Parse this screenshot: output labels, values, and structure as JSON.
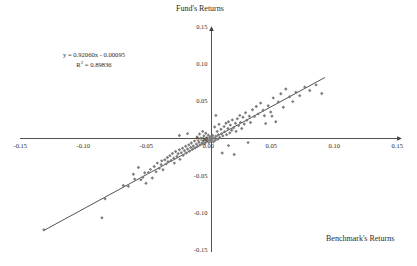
{
  "chart_data": {
    "type": "scatter",
    "title": "",
    "xlabel": "Benchmark's Returns",
    "ylabel": "Fund's Returns",
    "xlim": [
      -0.15,
      0.15
    ],
    "ylim": [
      -0.15,
      0.15
    ],
    "xticks": [
      -0.15,
      -0.1,
      -0.05,
      0.0,
      0.05,
      0.1,
      0.15
    ],
    "xtick_labels": [
      "-0.15",
      "-0.10",
      "-0.05",
      "0.00",
      "0.05",
      "0.10",
      "0.15"
    ],
    "yticks": [
      -0.15,
      -0.1,
      -0.05,
      0.0,
      0.05,
      0.1,
      0.15
    ],
    "ytick_labels": [
      "-0.15",
      "-0.10",
      "-0.05",
      "0.00",
      "0.05",
      "0.10",
      "0.15"
    ],
    "grid": false,
    "legend": false,
    "axes_style": "origin-centered-with-arrows",
    "marker": "diamond",
    "marker_color": "#7c7c7c",
    "trendline": {
      "slope": 0.9206,
      "intercept": -0.00095,
      "r_squared": 0.89836,
      "equation_label": "y = 0.92060x - 0.00095",
      "r2_label": "R² = 0.89836",
      "x_start": -0.133,
      "x_end": 0.09,
      "color": "#3f3f3f"
    },
    "points": [
      [
        -0.133,
        -0.1225
      ],
      [
        -0.087,
        -0.1065
      ],
      [
        -0.0845,
        -0.081
      ],
      [
        -0.07,
        -0.063
      ],
      [
        -0.066,
        -0.064
      ],
      [
        -0.062,
        -0.048
      ],
      [
        -0.061,
        -0.0545
      ],
      [
        -0.058,
        -0.039
      ],
      [
        -0.056,
        -0.0555
      ],
      [
        -0.0545,
        -0.052
      ],
      [
        -0.053,
        -0.046
      ],
      [
        -0.052,
        -0.06
      ],
      [
        -0.05,
        -0.0455
      ],
      [
        -0.0485,
        -0.0415
      ],
      [
        -0.047,
        -0.053
      ],
      [
        -0.0455,
        -0.0375
      ],
      [
        -0.044,
        -0.0445
      ],
      [
        -0.043,
        -0.033
      ],
      [
        -0.0415,
        -0.04
      ],
      [
        -0.04,
        -0.035
      ],
      [
        -0.0395,
        -0.03
      ],
      [
        -0.0385,
        -0.042
      ],
      [
        -0.037,
        -0.0285
      ],
      [
        -0.036,
        -0.034
      ],
      [
        -0.035,
        -0.0255
      ],
      [
        -0.0345,
        -0.031
      ],
      [
        -0.033,
        -0.023
      ],
      [
        -0.032,
        -0.0295
      ],
      [
        -0.031,
        -0.02
      ],
      [
        -0.03,
        -0.0265
      ],
      [
        -0.0295,
        -0.033
      ],
      [
        -0.0285,
        -0.0175
      ],
      [
        -0.0275,
        -0.024
      ],
      [
        -0.0265,
        -0.0205
      ],
      [
        -0.0255,
        -0.015
      ],
      [
        -0.025,
        -0.028
      ],
      [
        -0.024,
        -0.019
      ],
      [
        -0.023,
        -0.013
      ],
      [
        -0.0225,
        -0.0225
      ],
      [
        -0.0215,
        -0.0165
      ],
      [
        -0.0205,
        -0.0105
      ],
      [
        -0.02,
        -0.0195
      ],
      [
        -0.019,
        -0.014
      ],
      [
        -0.018,
        -0.0085
      ],
      [
        -0.0175,
        -0.017
      ],
      [
        -0.0165,
        -0.012
      ],
      [
        -0.016,
        -0.006
      ],
      [
        -0.015,
        -0.0145
      ],
      [
        -0.0145,
        -0.01
      ],
      [
        -0.0135,
        -0.0035
      ],
      [
        -0.013,
        -0.0125
      ],
      [
        -0.012,
        -0.0075
      ],
      [
        -0.0115,
        0.002
      ],
      [
        -0.011,
        -0.0105
      ],
      [
        -0.01,
        -0.005
      ],
      [
        -0.0095,
        0.006
      ],
      [
        -0.009,
        -0.0085
      ],
      [
        -0.0085,
        0.0005
      ],
      [
        -0.0075,
        -0.006
      ],
      [
        -0.007,
        0.0095
      ],
      [
        -0.0065,
        -0.0035
      ],
      [
        -0.006,
        0.0035
      ],
      [
        -0.0055,
        -0.007
      ],
      [
        -0.005,
        -0.0015
      ],
      [
        -0.0045,
        0.007
      ],
      [
        -0.004,
        -0.0045
      ],
      [
        -0.0035,
        0.001
      ],
      [
        -0.003,
        -0.0025
      ],
      [
        -0.0025,
        0.0045
      ],
      [
        -0.002,
        -0.0055
      ],
      [
        -0.0015,
        0.0
      ],
      [
        -0.001,
        0.0025
      ],
      [
        -0.0005,
        -0.0035
      ],
      [
        0.0,
        0.0015
      ],
      [
        0.0005,
        -0.0015
      ],
      [
        0.001,
        0.004
      ],
      [
        0.0015,
        -0.0045
      ],
      [
        0.002,
        0.0005
      ],
      [
        0.0025,
        0.0155
      ],
      [
        0.003,
        -0.0025
      ],
      [
        0.0035,
        0.003
      ],
      [
        0.0045,
        0.0095
      ],
      [
        0.005,
        -0.001
      ],
      [
        0.0055,
        0.005
      ],
      [
        0.006,
        0.019
      ],
      [
        0.0065,
        0.0015
      ],
      [
        0.0075,
        0.0125
      ],
      [
        0.008,
        0.0065
      ],
      [
        0.0085,
        -0.0195
      ],
      [
        0.009,
        0.0035
      ],
      [
        0.01,
        0.016
      ],
      [
        0.0105,
        0.009
      ],
      [
        0.0115,
        0.0205
      ],
      [
        0.012,
        0.005
      ],
      [
        0.013,
        0.0135
      ],
      [
        0.0135,
        0.0225
      ],
      [
        0.0145,
        0.0075
      ],
      [
        0.015,
        0.018
      ],
      [
        0.016,
        0.011
      ],
      [
        0.0165,
        0.025
      ],
      [
        0.0175,
        0.0145
      ],
      [
        0.018,
        -0.0215
      ],
      [
        0.019,
        0.0205
      ],
      [
        0.0195,
        0.0095
      ],
      [
        0.0205,
        0.0265
      ],
      [
        0.0215,
        0.0175
      ],
      [
        0.0225,
        0.031
      ],
      [
        0.023,
        0.0215
      ],
      [
        0.024,
        0.0135
      ],
      [
        0.025,
        0.0285
      ],
      [
        0.026,
        0.0195
      ],
      [
        0.027,
        0.0345
      ],
      [
        0.028,
        0.0245
      ],
      [
        0.029,
        -0.0055
      ],
      [
        0.03,
        0.03
      ],
      [
        0.031,
        0.0215
      ],
      [
        0.0325,
        0.0385
      ],
      [
        0.034,
        0.0295
      ],
      [
        0.0355,
        0.043
      ],
      [
        0.037,
        0.033
      ],
      [
        0.039,
        0.0475
      ],
      [
        0.041,
        0.038
      ],
      [
        0.043,
        0.02
      ],
      [
        0.045,
        0.044
      ],
      [
        0.047,
        0.0355
      ],
      [
        0.049,
        0.0545
      ],
      [
        0.051,
        0.0225
      ],
      [
        0.053,
        0.049
      ],
      [
        0.055,
        0.06
      ],
      [
        0.057,
        0.042
      ],
      [
        0.059,
        0.0665
      ],
      [
        0.062,
        0.056
      ],
      [
        0.0645,
        0.0495
      ],
      [
        0.067,
        0.062
      ],
      [
        0.07,
        0.0575
      ],
      [
        0.074,
        0.069
      ],
      [
        0.078,
        0.0645
      ],
      [
        0.083,
        0.072
      ],
      [
        0.0875,
        0.0605
      ],
      [
        0.0135,
        -0.0095
      ],
      [
        -0.019,
        0.0065
      ],
      [
        -0.0255,
        0.004
      ],
      [
        0.0035,
        0.031
      ],
      [
        0.042,
        0.0305
      ],
      [
        0.048,
        0.03
      ]
    ]
  },
  "annotations": {
    "equation": "y = 0.92060x - 0.00095",
    "r_squared_prefix": "R",
    "r_squared_sup": "2",
    "r_squared_value": " = 0.89836"
  }
}
